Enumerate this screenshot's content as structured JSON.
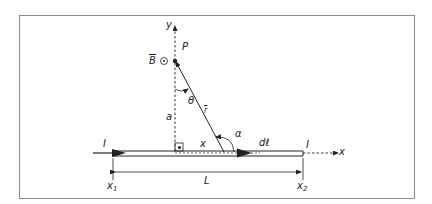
{
  "diagram": {
    "colors": {
      "frame": "#8a8a8a",
      "line": "#222222",
      "background": "#ffffff"
    },
    "labels": {
      "y_axis": "y",
      "x_axis": "x",
      "point": "P",
      "field": "B",
      "field_symbol": "⊙",
      "distance_a": "a",
      "angle_theta": "θ",
      "vector_r": "r",
      "angle_alpha": "α",
      "element_dl": "dℓ",
      "position_x": "x",
      "current_left": "I",
      "current_right": "I",
      "x1": "x",
      "x1_sub": "1",
      "x2": "x",
      "x2_sub": "2",
      "length": "L"
    }
  }
}
